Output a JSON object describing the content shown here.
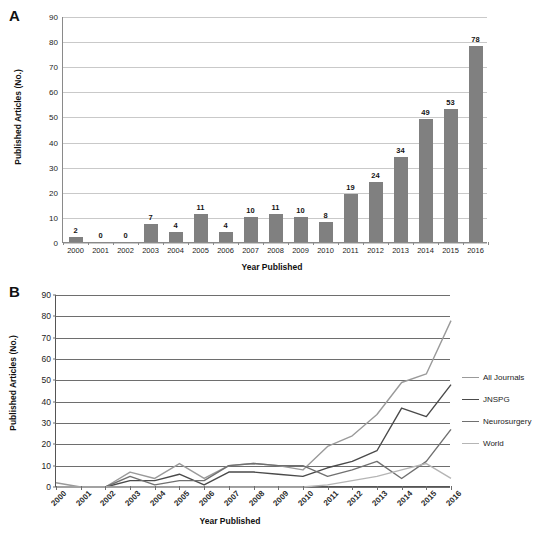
{
  "figure": {
    "panels": [
      {
        "letter": "A",
        "chart_index": 0
      },
      {
        "letter": "B",
        "chart_index": 1
      }
    ]
  },
  "chart_data": [
    {
      "type": "bar",
      "panel": "A",
      "title": "",
      "xlabel": "Year Published",
      "ylabel": "Published Articles (No.)",
      "ylim": [
        0,
        90
      ],
      "yticks": [
        0,
        10,
        20,
        30,
        40,
        50,
        60,
        70,
        80,
        90
      ],
      "grid": true,
      "legend": false,
      "bar_color": "#808080",
      "data_labels": true,
      "categories": [
        "2000",
        "2001",
        "2002",
        "2003",
        "2004",
        "2005",
        "2006",
        "2007",
        "2008",
        "2009",
        "2010",
        "2011",
        "2012",
        "2013",
        "2014",
        "2015",
        "2016"
      ],
      "values": [
        2,
        0,
        0,
        7,
        4,
        11,
        4,
        10,
        11,
        10,
        8,
        19,
        24,
        34,
        49,
        53,
        78
      ]
    },
    {
      "type": "line",
      "panel": "B",
      "title": "",
      "xlabel": "Year Published",
      "ylabel": "Published Articles (No.)",
      "ylim": [
        0,
        90
      ],
      "yticks": [
        0,
        10,
        20,
        30,
        40,
        50,
        60,
        70,
        80,
        90
      ],
      "grid": true,
      "legend": true,
      "legend_position": "right",
      "x": [
        "2000",
        "2001",
        "2002",
        "2003",
        "2004",
        "2005",
        "2006",
        "2007",
        "2008",
        "2009",
        "2010",
        "2011",
        "2012",
        "2013",
        "2014",
        "2015",
        "2016"
      ],
      "series": [
        {
          "name": "All Journals",
          "color": "#9a9a9a",
          "values": [
            2,
            0,
            0,
            7,
            4,
            11,
            4,
            10,
            11,
            10,
            8,
            19,
            24,
            34,
            49,
            53,
            78
          ]
        },
        {
          "name": "JNSPG",
          "color": "#4a4a4a",
          "values": [
            0,
            0,
            0,
            3,
            3,
            6,
            1,
            7,
            7,
            6,
            5,
            9,
            12,
            17,
            37,
            33,
            48
          ]
        },
        {
          "name": "Neurosurgery",
          "color": "#707070",
          "values": [
            0,
            0,
            0,
            5,
            1,
            3,
            3,
            10,
            11,
            10,
            10,
            5,
            8,
            12,
            4,
            12,
            27
          ]
        },
        {
          "name": "World",
          "color": "#b5b5b5",
          "values": [
            0,
            0,
            0,
            0,
            0,
            0,
            0,
            0,
            0,
            0,
            0,
            1,
            3,
            5,
            8,
            11,
            4
          ]
        }
      ]
    }
  ]
}
